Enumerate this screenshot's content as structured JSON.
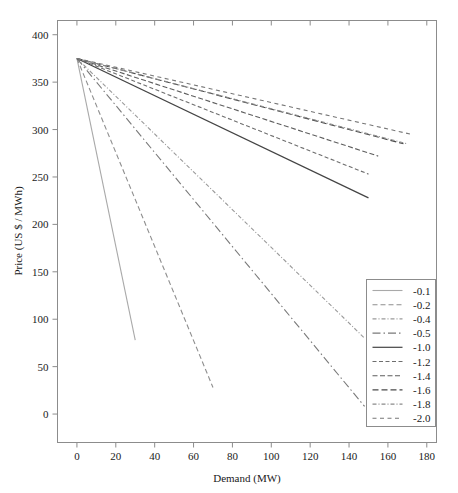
{
  "chart_data": {
    "type": "line",
    "title": "",
    "subtitle": "",
    "xlabel": "Demand (MW)",
    "ylabel": "Price (US $ / MWh)",
    "xlim": [
      -10,
      185
    ],
    "ylim": [
      -30,
      415
    ],
    "xticks": [
      0,
      20,
      40,
      60,
      80,
      100,
      120,
      140,
      160,
      180
    ],
    "xtick_labels": [
      "0",
      "20",
      "40",
      "60",
      "80",
      "100",
      "120",
      "140",
      "160",
      "180"
    ],
    "yticks": [
      0,
      50,
      100,
      150,
      200,
      250,
      300,
      350,
      400
    ],
    "ytick_labels": [
      "0",
      "50",
      "100",
      "150",
      "200",
      "250",
      "300",
      "350",
      "400"
    ],
    "grid": false,
    "legend_position": "lower-right",
    "legend_title": "",
    "intercept": 375,
    "series": [
      {
        "name": "-0.1",
        "label": "-0.1",
        "elasticity": -0.1,
        "dash": "solid",
        "color": "#a9a9a9",
        "width": 1.1,
        "x": [
          0,
          30
        ],
        "y": [
          375,
          78
        ]
      },
      {
        "name": "-0.2",
        "label": "-0.2",
        "elasticity": -0.2,
        "dash": "dashed",
        "color": "#8f8f8f",
        "width": 1.1,
        "x": [
          0,
          70
        ],
        "y": [
          375,
          28
        ]
      },
      {
        "name": "-0.4",
        "label": "-0.4",
        "elasticity": -0.4,
        "dash": "dashdot-fine",
        "color": "#9a9a9a",
        "width": 1.1,
        "x": [
          0,
          148
        ],
        "y": [
          375,
          80
        ]
      },
      {
        "name": "-0.5",
        "label": "-0.5",
        "elasticity": -0.5,
        "dash": "longdashdot",
        "color": "#7a7a7a",
        "width": 1.1,
        "x": [
          0,
          148
        ],
        "y": [
          375,
          8
        ]
      },
      {
        "name": "-1.0",
        "label": "-1.0",
        "elasticity": -1.0,
        "dash": "solid",
        "color": "#444444",
        "width": 1.2,
        "x": [
          0,
          150
        ],
        "y": [
          375,
          228
        ]
      },
      {
        "name": "-1.2",
        "label": "-1.2",
        "elasticity": -1.2,
        "dash": "dashed-short",
        "color": "#6e6e6e",
        "width": 1.1,
        "x": [
          0,
          150
        ],
        "y": [
          375,
          253
        ]
      },
      {
        "name": "-1.4",
        "label": "-1.4",
        "elasticity": -1.4,
        "dash": "dashed-med",
        "color": "#5e5e5e",
        "width": 1.1,
        "x": [
          0,
          155
        ],
        "y": [
          375,
          272
        ]
      },
      {
        "name": "-1.6",
        "label": "-1.6",
        "elasticity": -1.6,
        "dash": "dashed-long",
        "color": "#4a4a4a",
        "width": 1.1,
        "x": [
          0,
          168
        ],
        "y": [
          375,
          285
        ]
      },
      {
        "name": "-1.8",
        "label": "-1.8",
        "elasticity": -1.8,
        "dash": "dashdot-fine",
        "color": "#8a8a8a",
        "width": 1.1,
        "x": [
          0,
          170
        ],
        "y": [
          375,
          285
        ]
      },
      {
        "name": "-2.0",
        "label": "-2.0",
        "elasticity": -2.0,
        "dash": "dashed-sparse",
        "color": "#777777",
        "width": 1.1,
        "x": [
          0,
          172
        ],
        "y": [
          375,
          295
        ]
      }
    ]
  },
  "plot": {
    "frame_color": "#8c8c8c",
    "background": "#ffffff"
  },
  "legend": {
    "items": [
      {
        "label": "-0.1"
      },
      {
        "label": "-0.2"
      },
      {
        "label": "-0.4"
      },
      {
        "label": "-0.5"
      },
      {
        "label": "-1.0"
      },
      {
        "label": "-1.2"
      },
      {
        "label": "-1.4"
      },
      {
        "label": "-1.6"
      },
      {
        "label": "-1.8"
      },
      {
        "label": "-2.0"
      }
    ]
  }
}
